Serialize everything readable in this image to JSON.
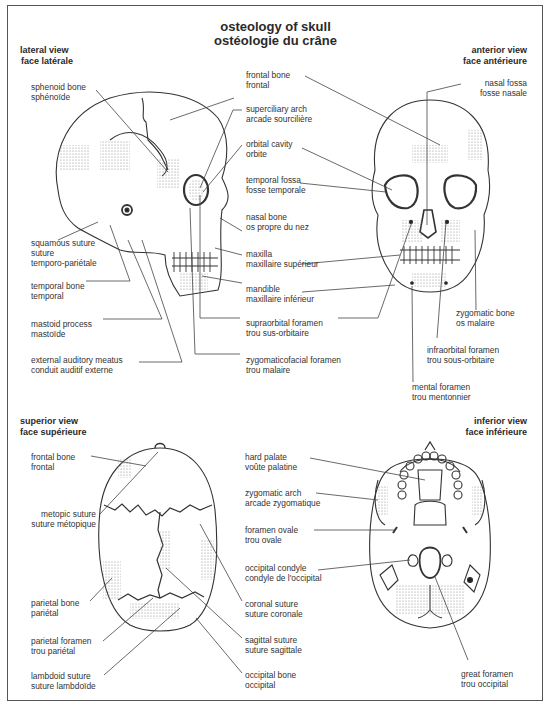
{
  "title": {
    "en": "osteology of skull",
    "fr": "ostéologie du crâne"
  },
  "views": {
    "lateral": {
      "heading_en": "lateral view",
      "heading_fr": "face latérale",
      "labels": [
        {
          "en": "sphenoid bone",
          "fr": "sphénoïde"
        },
        {
          "en": "squamous suture",
          "fr": "suture",
          "fr2": "temporo-pariétale"
        },
        {
          "en": "temporal bone",
          "fr": "temporal"
        },
        {
          "en": "mastoid process",
          "fr": "mastoïde"
        },
        {
          "en": "external auditory meatus",
          "fr": "conduit auditif externe"
        }
      ]
    },
    "center_labels": [
      {
        "en": "frontal bone",
        "fr": "frontal"
      },
      {
        "en": "superciliary arch",
        "fr": "arcade sourcilière"
      },
      {
        "en": "orbital cavity",
        "fr": "orbite"
      },
      {
        "en": "temporal fossa",
        "fr": "fosse temporale"
      },
      {
        "en": "nasal bone",
        "fr": "os propre du nez"
      },
      {
        "en": "maxilla",
        "fr": "maxillaire supérieur"
      },
      {
        "en": "mandible",
        "fr": "maxillaire inférieur"
      },
      {
        "en": "supraorbital foramen",
        "fr": "trou sus-orbitaire"
      },
      {
        "en": "zygomaticofacial foramen",
        "fr": "trou malaire"
      }
    ],
    "anterior": {
      "heading_en": "anterior view",
      "heading_fr": "face antérieure",
      "labels": [
        {
          "en": "nasal fossa",
          "fr": "fosse nasale"
        },
        {
          "en": "zygomatic bone",
          "fr": "os malaire"
        },
        {
          "en": "infraorbital foramen",
          "fr": "trou sous-orbitaire"
        },
        {
          "en": "mental foramen",
          "fr": "trou mentonnier"
        }
      ]
    },
    "superior": {
      "heading_en": "superior view",
      "heading_fr": "face supérieure",
      "labels_left": [
        {
          "en": "frontal bone",
          "fr": "frontal"
        },
        {
          "en": "metopic suture",
          "fr": "suture métopique"
        },
        {
          "en": "parietal bone",
          "fr": "pariétal"
        },
        {
          "en": "parietal foramen",
          "fr": "trou pariétal"
        },
        {
          "en": "lambdoid suture",
          "fr": "suture lambdoïde"
        }
      ],
      "labels_right": [
        {
          "en": "coronal suture",
          "fr": "suture coronale"
        },
        {
          "en": "sagittal suture",
          "fr": "suture sagittale"
        },
        {
          "en": "occipital bone",
          "fr": "occipital"
        }
      ]
    },
    "inferior": {
      "heading_en": "inferior view",
      "heading_fr": "face inférieure",
      "labels": [
        {
          "en": "hard palate",
          "fr": "voûte palatine"
        },
        {
          "en": "zygomatic arch",
          "fr": "arcade zygomatique"
        },
        {
          "en": "foramen ovale",
          "fr": "trou ovale"
        },
        {
          "en": "occipital condyle",
          "fr": "condyle de l'occipital"
        },
        {
          "en": "great foramen",
          "fr": "trou occipital"
        }
      ]
    }
  },
  "colors": {
    "ink": "#2a2a2a",
    "line": "#444444",
    "shade": "#bdbdbd",
    "frame": "#555555"
  }
}
